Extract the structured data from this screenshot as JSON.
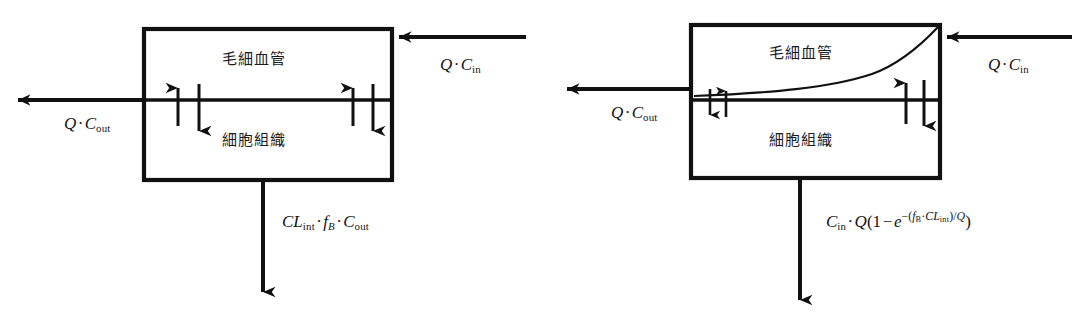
{
  "figure": {
    "background_color": "#ffffff",
    "stroke_color": "#111111",
    "panels": [
      {
        "id": "left",
        "name": "well-stirred-model",
        "box": {
          "x": 144,
          "y": 29,
          "width": 248,
          "height": 151,
          "divider_y": 100
        },
        "compartments": {
          "upper_label": "毛細血管",
          "lower_label": "細胞組織"
        },
        "inflow_label": "Q·C_in",
        "outflow_label": "Q·C_out",
        "elimination_label": "CL_int·f_B·C_out",
        "has_gradient_curve": false,
        "exchange_arrow_pairs": 2
      },
      {
        "id": "right",
        "name": "dispersion-tube-model",
        "box": {
          "x": 691,
          "y": 25,
          "width": 249,
          "height": 153,
          "divider_y": 100
        },
        "compartments": {
          "upper_label": "毛細血管",
          "lower_label": "細胞組織"
        },
        "inflow_label": "Q·C_in",
        "outflow_label": "Q·C_out",
        "elimination_label": "C_in·Q(1 − e^−(f_B·CL_int)/Q)",
        "has_gradient_curve": true,
        "exchange_arrow_pairs": 2
      }
    ]
  },
  "labels": {
    "capillary_jp": "毛細血管",
    "tissue_jp": "細胞組織",
    "Q": "Q",
    "C": "C",
    "CL": "CL",
    "f": "f",
    "e": "e",
    "sub_in": "in",
    "sub_out": "out",
    "sub_int": "int",
    "sub_B": "B",
    "dot": "·",
    "minus": "−",
    "one": "1",
    "paren_open": "(",
    "paren_close": ")",
    "slash": "/"
  }
}
